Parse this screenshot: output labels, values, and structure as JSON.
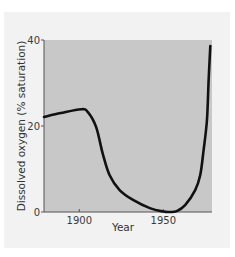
{
  "chart_data": {
    "type": "line",
    "title": "",
    "xlabel": "Year",
    "ylabel": "Dissolved oxygen (% saturation)",
    "xlim": [
      1879,
      1979
    ],
    "ylim": [
      0,
      40
    ],
    "x_ticks": [
      1900,
      1950
    ],
    "x_tick_labels": [
      "1900",
      "1950"
    ],
    "y_ticks": [
      0,
      20,
      40
    ],
    "y_tick_labels": [
      "0",
      "20",
      "40"
    ],
    "grid": false,
    "legend": null,
    "colors": {
      "plot_background": "#c8c8c8",
      "page_background": "#f2f2f2",
      "line": "#111111"
    },
    "series": [
      {
        "name": "Dissolved oxygen",
        "x": [
          1879,
          1889,
          1901,
          1905,
          1910,
          1914,
          1918,
          1924,
          1932,
          1942,
          1950,
          1954,
          1958,
          1963,
          1969,
          1972,
          1974,
          1976,
          1977,
          1978
        ],
        "values": [
          22.1,
          23.0,
          23.9,
          23.3,
          19.8,
          13.5,
          8.6,
          5.1,
          2.8,
          0.9,
          0.1,
          0.0,
          0.2,
          1.6,
          5.1,
          8.6,
          14.4,
          21.4,
          30.7,
          38.6
        ]
      }
    ]
  }
}
